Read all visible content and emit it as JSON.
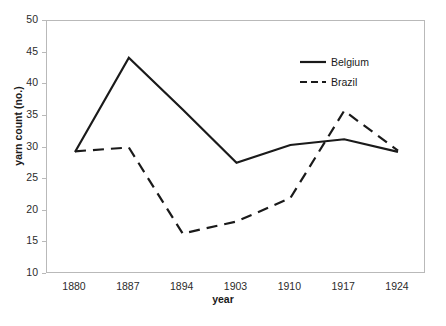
{
  "chart_data": {
    "type": "line",
    "title": "",
    "xlabel": "year",
    "ylabel": "yarn count (no.)",
    "categories": [
      "1880",
      "1887",
      "1894",
      "1903",
      "1910",
      "1917",
      "1924"
    ],
    "x": [
      1880,
      1887,
      1894,
      1903,
      1910,
      1917,
      1924
    ],
    "ylim": [
      10,
      50
    ],
    "yticks": [
      10,
      15,
      20,
      25,
      30,
      35,
      40,
      45,
      50
    ],
    "ytick_labels": [
      "10",
      "15",
      "20",
      "25",
      "30",
      "35",
      "40",
      "45",
      "50"
    ],
    "grid": false,
    "legend_position": "upper right",
    "series": [
      {
        "name": "Belgium",
        "style": "solid",
        "color": "#1a1a1a",
        "values": [
          29.3,
          44.2,
          36.0,
          27.6,
          30.4,
          31.3,
          29.3
        ]
      },
      {
        "name": "Brazil",
        "style": "dashed",
        "color": "#1a1a1a",
        "values": [
          29.4,
          30.0,
          16.4,
          18.3,
          22.0,
          35.8,
          29.5
        ]
      }
    ]
  },
  "axes": {
    "y_title": "yarn count (no.)",
    "x_title": "year"
  },
  "legend": {
    "items": [
      {
        "label": "Belgium",
        "style": "solid"
      },
      {
        "label": "Brazil",
        "style": "dashed"
      }
    ]
  },
  "colors": {
    "line": "#1a1a1a",
    "frame": "#b9b9b9",
    "text": "#1a1a1a",
    "background": "#ffffff"
  }
}
